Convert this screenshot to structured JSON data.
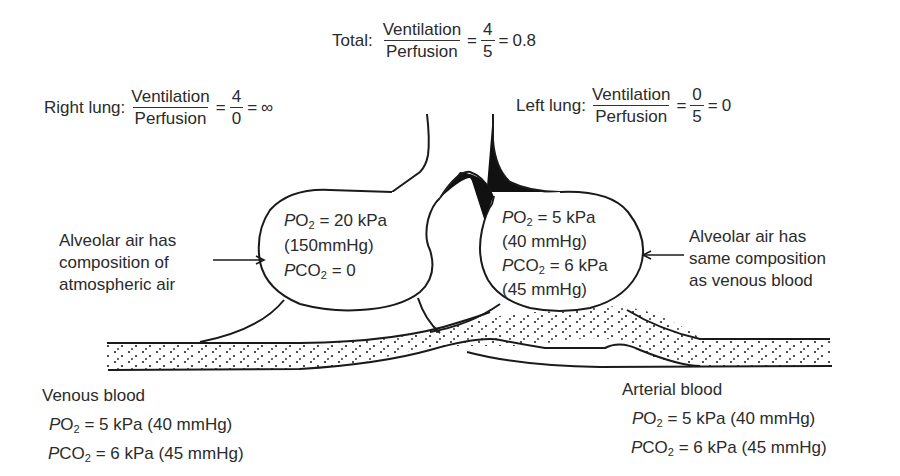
{
  "total_equation": {
    "label": "Total:",
    "numerator": "Ventilation",
    "denominator": "Perfusion",
    "op1": "=",
    "ratio_num": "4",
    "ratio_den": "5",
    "op2": "=",
    "result": "0.8"
  },
  "right_lung_equation": {
    "label": "Right lung:",
    "numerator": "Ventilation",
    "denominator": "Perfusion",
    "op1": "=",
    "ratio_num": "4",
    "ratio_den": "0",
    "op2": "=",
    "result": "∞"
  },
  "left_lung_equation": {
    "label": "Left lung:",
    "numerator": "Ventilation",
    "denominator": "Perfusion",
    "op1": "=",
    "ratio_num": "0",
    "ratio_den": "5",
    "op2": "=",
    "result": "0"
  },
  "right_alveolus": {
    "po2_prefix": "P",
    "po2_gas": "O",
    "po2_sub": "2",
    "po2_value": " = 20 kPa",
    "po2_mmhg": "(150mmHg)",
    "pco2_prefix": "P",
    "pco2_gas": "CO",
    "pco2_sub": "2",
    "pco2_value": " = 0"
  },
  "left_alveolus": {
    "po2_prefix": "P",
    "po2_gas": "O",
    "po2_sub": "2",
    "po2_value": " = 5 kPa",
    "po2_mmhg": "(40 mmHg)",
    "pco2_prefix": "P",
    "pco2_gas": "CO",
    "pco2_sub": "2",
    "pco2_value": " = 6 kPa",
    "pco2_mmhg": "(45 mmHg)"
  },
  "annotation_left": {
    "lines": [
      "Alveolar air has",
      "composition of",
      "atmospheric air"
    ]
  },
  "annotation_right": {
    "lines": [
      "Alveolar air has",
      "same composition",
      "as venous blood"
    ]
  },
  "venous_blood": {
    "title": "Venous blood",
    "po2_prefix": "P",
    "po2_gas": "O",
    "po2_sub": "2",
    "po2_value": " = 5 kPa (40 mmHg)",
    "pco2_prefix": "P",
    "pco2_gas": "CO",
    "pco2_sub": "2",
    "pco2_value": " = 6 kPa (45 mmHg)"
  },
  "arterial_blood": {
    "title": "Arterial blood",
    "po2_prefix": "P",
    "po2_gas": "O",
    "po2_sub": "2",
    "po2_value": " = 5 kPa (40 mmHg)",
    "pco2_prefix": "P",
    "pco2_gas": "CO",
    "pco2_sub": "2",
    "pco2_value": " = 6 kPa (45 mmHg)"
  },
  "colors": {
    "line": "#1a1a1a",
    "text": "#2b2b2b",
    "background": "#ffffff"
  }
}
